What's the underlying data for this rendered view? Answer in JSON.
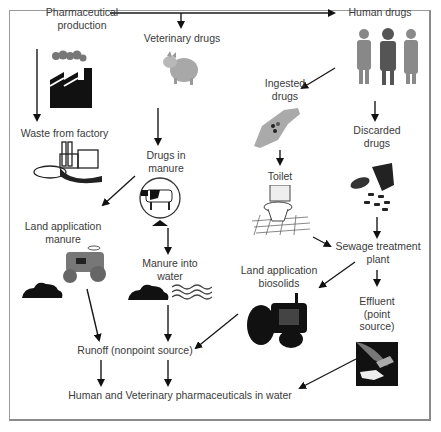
{
  "diagram": {
    "nodes": {
      "pharma_production": [
        "Pharmaceutical",
        "production"
      ],
      "veterinary_drugs": "Veterinary drugs",
      "human_drugs": "Human drugs",
      "ingested_drugs": [
        "Ingested",
        "drugs"
      ],
      "discarded_drugs": [
        "Discarded",
        "drugs"
      ],
      "waste_factory": "Waste from factory",
      "drugs_in_manure": [
        "Drugs in",
        "manure"
      ],
      "toilet": "Toilet",
      "land_app_manure": [
        "Land application",
        "manure"
      ],
      "sewage_plant": [
        "Sewage treatment",
        "plant"
      ],
      "manure_into_water": [
        "Manure into",
        "water"
      ],
      "land_app_biosolids": [
        "Land application",
        "biosolids"
      ],
      "effluent": [
        "Effluent",
        "(point",
        "source)"
      ],
      "runoff": "Runoff (nonpoint source)",
      "final": "Human and Veterinary pharmaceuticals in water"
    },
    "edges": [
      [
        "Pharmaceutical production",
        "Veterinary drugs"
      ],
      [
        "Pharmaceutical production",
        "Human drugs"
      ],
      [
        "Pharmaceutical production",
        "Waste from factory"
      ],
      [
        "Veterinary drugs",
        "Drugs in manure"
      ],
      [
        "Human drugs",
        "Ingested drugs"
      ],
      [
        "Human drugs",
        "Discarded drugs"
      ],
      [
        "Ingested drugs",
        "Toilet"
      ],
      [
        "Toilet",
        "Sewage treatment plant"
      ],
      [
        "Discarded drugs",
        "Sewage treatment plant"
      ],
      [
        "Drugs in manure",
        "Land application manure"
      ],
      [
        "Drugs in manure",
        "Manure into water"
      ],
      [
        "Sewage treatment plant",
        "Land application biosolids"
      ],
      [
        "Sewage treatment plant",
        "Effluent (point source)"
      ],
      [
        "Land application manure",
        "Runoff (nonpoint source)"
      ],
      [
        "Manure into water",
        "Runoff (nonpoint source)"
      ],
      [
        "Land application biosolids",
        "Runoff (nonpoint source)"
      ],
      [
        "Runoff (nonpoint source)",
        "Human and Veterinary pharmaceuticals in water"
      ],
      [
        "Effluent (point source)",
        "Human and Veterinary pharmaceuticals in water"
      ]
    ],
    "icons": [
      "factory-smoke-icon",
      "pig-icon",
      "elderly-people-icon",
      "hand-with-pills-icon",
      "pill-bottle-icon",
      "industrial-plant-pipe-icon",
      "cow-icon",
      "toilet-icon",
      "lawn-tractor-icon",
      "manure-pile-icon",
      "water-waves-icon",
      "farm-tractor-icon",
      "effluent-pipe-icon"
    ],
    "colors": {
      "line": "#1a1a1a",
      "text": "#3a3a3a",
      "frame": "#9a9a9a"
    }
  }
}
